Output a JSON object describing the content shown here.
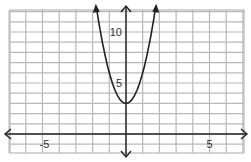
{
  "chart_data": {
    "type": "line",
    "title": "",
    "xlabel": "",
    "ylabel": "",
    "function": "y = 3x^2 + 3",
    "xlim": [
      -7,
      7
    ],
    "ylim": [
      -1,
      12
    ],
    "grid": true,
    "x_ticks_labeled": [
      {
        "value": -5,
        "label": "-5"
      },
      {
        "value": 5,
        "label": "5"
      }
    ],
    "y_ticks_labeled": [
      {
        "value": 5,
        "label": "5"
      },
      {
        "value": 10,
        "label": "10"
      }
    ],
    "series": [
      {
        "name": "parabola",
        "x": [
          -1.8,
          -1.5,
          -1,
          -0.5,
          0,
          0.5,
          1,
          1.5,
          1.8
        ],
        "y": [
          12.7,
          9.75,
          6,
          3.75,
          3,
          3.75,
          6,
          9.75,
          12.7
        ]
      }
    ],
    "vertex": [
      0,
      3
    ],
    "colors": {
      "grid": "#b8b8b8",
      "axis": "#222222",
      "curve": "#222222"
    }
  }
}
